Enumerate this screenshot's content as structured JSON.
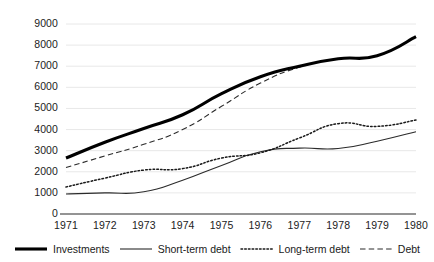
{
  "chart_data": {
    "type": "line",
    "title": "",
    "subtitle": "",
    "xlabel": "",
    "ylabel": "",
    "x": [
      1971,
      1972,
      1973,
      1974,
      1975,
      1976,
      1977,
      1978,
      1979,
      1980
    ],
    "categories": [
      "1971",
      "1972",
      "1973",
      "1974",
      "1975",
      "1976",
      "1977",
      "1978",
      "1979",
      "1980"
    ],
    "xlim": [
      1971,
      1980
    ],
    "ylim": [
      0,
      9000
    ],
    "yticks": [
      0,
      1000,
      2000,
      3000,
      4000,
      5000,
      6000,
      7000,
      8000,
      9000
    ],
    "ytick_labels": [
      "0",
      "1000",
      "2000",
      "3000",
      "4000",
      "5000",
      "6000",
      "7000",
      "8000",
      "9000"
    ],
    "grid": true,
    "grid_axis": "y",
    "legend_position": "bottom",
    "series": [
      {
        "name": "Investments",
        "style": "solid-thick",
        "color": "#000000",
        "width": 3.1,
        "values": [
          2650,
          3400,
          4050,
          4700,
          5700,
          6500,
          7000,
          7350,
          7500,
          8400
        ]
      },
      {
        "name": "Short-term debt",
        "style": "solid-thin",
        "color": "#2b2b2b",
        "width": 1.1,
        "values": [
          950,
          1000,
          1050,
          1600,
          2300,
          2950,
          3120,
          3100,
          3450,
          3900
        ]
      },
      {
        "name": "Long-term debt",
        "style": "dotted",
        "color": "#1a1a1a",
        "width": 1.5,
        "values": [
          1280,
          1700,
          2080,
          2150,
          2650,
          2900,
          3600,
          4280,
          4150,
          4450
        ]
      },
      {
        "name": "Debt",
        "style": "dashed",
        "color": "#2b2b2b",
        "width": 1.1,
        "values": [
          2200,
          2750,
          3300,
          4000,
          5100,
          6200,
          6950,
          7350,
          7500,
          8400
        ]
      }
    ]
  },
  "legend": {
    "items": [
      {
        "label": "Investments",
        "swatch": "solid-thick-swatch"
      },
      {
        "label": "Short-term debt",
        "swatch": "solid-thin-swatch"
      },
      {
        "label": "Long-term debt",
        "swatch": "dotted-swatch"
      },
      {
        "label": "Debt",
        "swatch": "dashed-swatch"
      }
    ]
  },
  "axes": {
    "grid_color": "#e2e2e2",
    "axis_color": "#2b2b2b",
    "tick_text_color": "#222222"
  }
}
